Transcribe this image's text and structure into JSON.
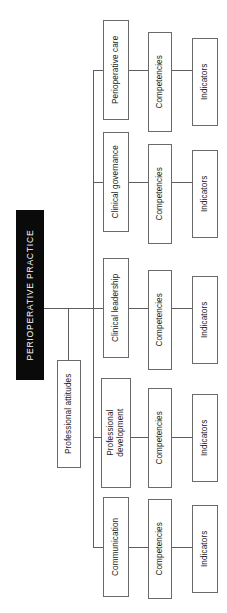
{
  "diagram": {
    "type": "hierarchy-tree",
    "orientation": "rotated-90-ccw",
    "colors": {
      "root_fill": "#0a0a0a",
      "root_text": "#ffffff",
      "node_fill": "#ffffff",
      "node_border": "#6a6a6a",
      "connector": "#5d5d5d",
      "background": "#ffffff"
    },
    "root": {
      "label": "PERIOPERATIVE PRACTICE"
    },
    "intermediate": {
      "label": "Professional attitudes"
    },
    "branches": [
      {
        "domain": "Perioperative care",
        "competencies": "Competencies",
        "indicators": "Indicators"
      },
      {
        "domain": "Clinical governance",
        "competencies": "Competencies",
        "indicators": "Indicators"
      },
      {
        "domain": "Clinical leadership",
        "competencies": "Competencies",
        "indicators": "Indicators"
      },
      {
        "domain": "Professional development",
        "competencies": "Competencies",
        "indicators": "Indicators"
      },
      {
        "domain": "Communication",
        "competencies": "Competencies",
        "indicators": "Indicators"
      }
    ]
  }
}
